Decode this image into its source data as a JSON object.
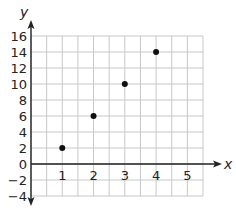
{
  "chart_data": {
    "type": "scatter",
    "title": "",
    "xlabel": "x",
    "ylabel": "y",
    "x": [
      1,
      2,
      3,
      4
    ],
    "y": [
      2,
      6,
      10,
      14
    ],
    "series": [
      {
        "name": "points",
        "points": [
          [
            1,
            2
          ],
          [
            2,
            6
          ],
          [
            3,
            10
          ],
          [
            4,
            14
          ]
        ]
      }
    ],
    "xlim": [
      0,
      5.5
    ],
    "ylim": [
      -4,
      16
    ],
    "x_ticks": [
      1,
      2,
      3,
      4,
      5
    ],
    "y_ticks": [
      16,
      14,
      12,
      10,
      8,
      6,
      4,
      2,
      0,
      -2,
      -4
    ],
    "x_grid_step": 0.5,
    "y_grid_step": 2,
    "grid": true,
    "legend": null
  },
  "colors": {
    "grid": "#c8c8c8",
    "axis": "#222222",
    "point": "#111111"
  }
}
